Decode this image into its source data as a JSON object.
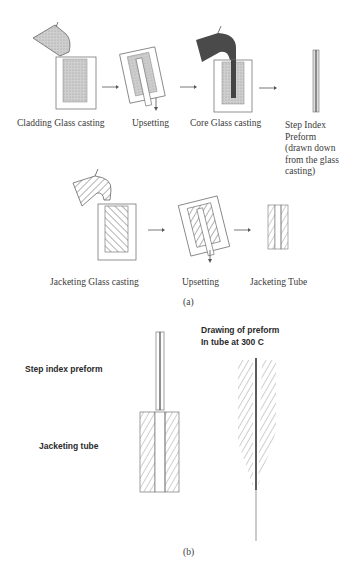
{
  "part_a": {
    "caption": "(a)",
    "row1": {
      "steps": [
        {
          "label": "Cladding Glass casting"
        },
        {
          "label": "Upsetting"
        },
        {
          "label": "Core Glass casting"
        },
        {
          "label": "Step Index\nPreform\n(drawn down\nfrom the glass\ncasting)"
        }
      ]
    },
    "row2": {
      "steps": [
        {
          "label": "Jacketing Glass casting"
        },
        {
          "label": "Upsetting"
        },
        {
          "label": "Jacketing Tube"
        }
      ]
    }
  },
  "part_b": {
    "caption": "(b)",
    "label_preform": "Step index preform",
    "label_jacket": "Jacketing tube",
    "label_drawing": "Drawing of preform\nIn tube at 300 C"
  },
  "colors": {
    "cladding_fill": "#c8c8c8",
    "core_fill": "#555555",
    "line": "#555555",
    "hatch": "#777777"
  }
}
